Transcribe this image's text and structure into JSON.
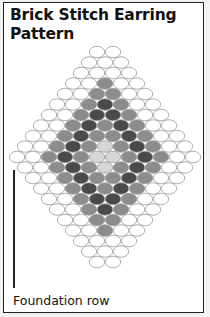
{
  "title": "Brick Stitch Earring Pattern",
  "foundation_label": "Foundation row",
  "colors": {
    "W": "#ffffff",
    "L": "#d6d6d6",
    "M": "#8c8c8c",
    "D": "#4a4a4a",
    "stroke": "#9a9a9a"
  },
  "bead": {
    "width": 16,
    "height": 11.5,
    "row_spacing": 10.5,
    "center_x": 105,
    "top_y": 52
  },
  "foundation_row_index": 10,
  "rows": [
    "WW",
    "WWW",
    "WWWW",
    "WWMWW",
    "WWMMWW",
    "WWMDMWW",
    "WWMDDMWW",
    "WWMDMDMWW",
    "WWMDMMDMWW",
    "WWMDMLMDMWW",
    "WWMDMLLMDMWW",
    "WWMDMLMDMWW",
    "WWMDMMDMWW",
    "WWMDMDMWW",
    "WWMDDMWW",
    "WWMDMWW",
    "WWMMWW",
    "WWMWW",
    "WWWW",
    "WWW",
    "WW"
  ]
}
